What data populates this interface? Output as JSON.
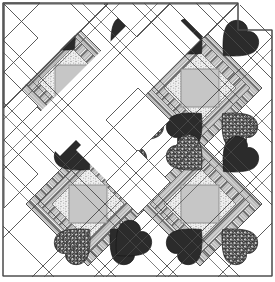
{
  "figure": {
    "name": "heart-quilt-pattern-diagram",
    "width": 275,
    "height": 282,
    "background": "#ffffff",
    "line_color": "#4a4a4a",
    "line_width": 0.9
  },
  "palette": {
    "background": "#ffffff",
    "outline": "#4a4a4a",
    "heart_dark_solid": "#2b2b2b",
    "heart_dark_alt": "#333333",
    "heart_speckle_dark": "#2e2e2e",
    "heart_speckle_light": "#d8d8d8",
    "center_square_gray": "#c6c6c6",
    "center_square_border": "#8a8a8a",
    "stipple_light": "#ededed",
    "stipple_dot": "#9a9a9a",
    "stripe_dark": "#6b6b6b",
    "stripe_mid": "#a8a8a8",
    "stripe_light": "#f2f2f2",
    "white_patch": "#ffffff"
  },
  "layout": {
    "description": "On-point (diagonal) set quilt of heart blocks with striped sashing bands, light gray center squares and white setting triangles on the stepped upper-left edge.",
    "grid": {
      "cell_size": 62,
      "columns": 4,
      "rows": 4,
      "origin_x": 3,
      "origin_y": 3
    },
    "border": {
      "shown": true,
      "style": "single thin outline following stepped top-left and straight right/bottom edges"
    }
  },
  "blocks": [
    {
      "id": "block-partial-top-left",
      "label": "Partial heart block, upper left",
      "center_x": 72,
      "center_y": 75,
      "complete": false,
      "hearts": 2,
      "has_center_square": true
    },
    {
      "id": "block-full-top-right",
      "label": "Full heart block, upper right",
      "center_x": 200,
      "center_y": 88,
      "complete": true,
      "hearts": 4,
      "has_center_square": true
    },
    {
      "id": "block-full-bottom-left",
      "label": "Full heart block, lower left",
      "center_x": 88,
      "center_y": 204,
      "complete": true,
      "hearts": 4,
      "has_center_square": true
    },
    {
      "id": "block-full-bottom-right",
      "label": "Full heart block, lower right",
      "center_x": 200,
      "center_y": 204,
      "complete": true,
      "hearts": 4,
      "has_center_square": true
    }
  ],
  "elements": {
    "setting_triangles_label": "White setting triangles",
    "center_square_label": "Light gray center square",
    "striped_band_label": "Striped diagonal sashing band",
    "heart_label": "Pieced heart patch",
    "stipple_label": "Stippled light patch"
  },
  "annotations": {
    "caption": ""
  }
}
